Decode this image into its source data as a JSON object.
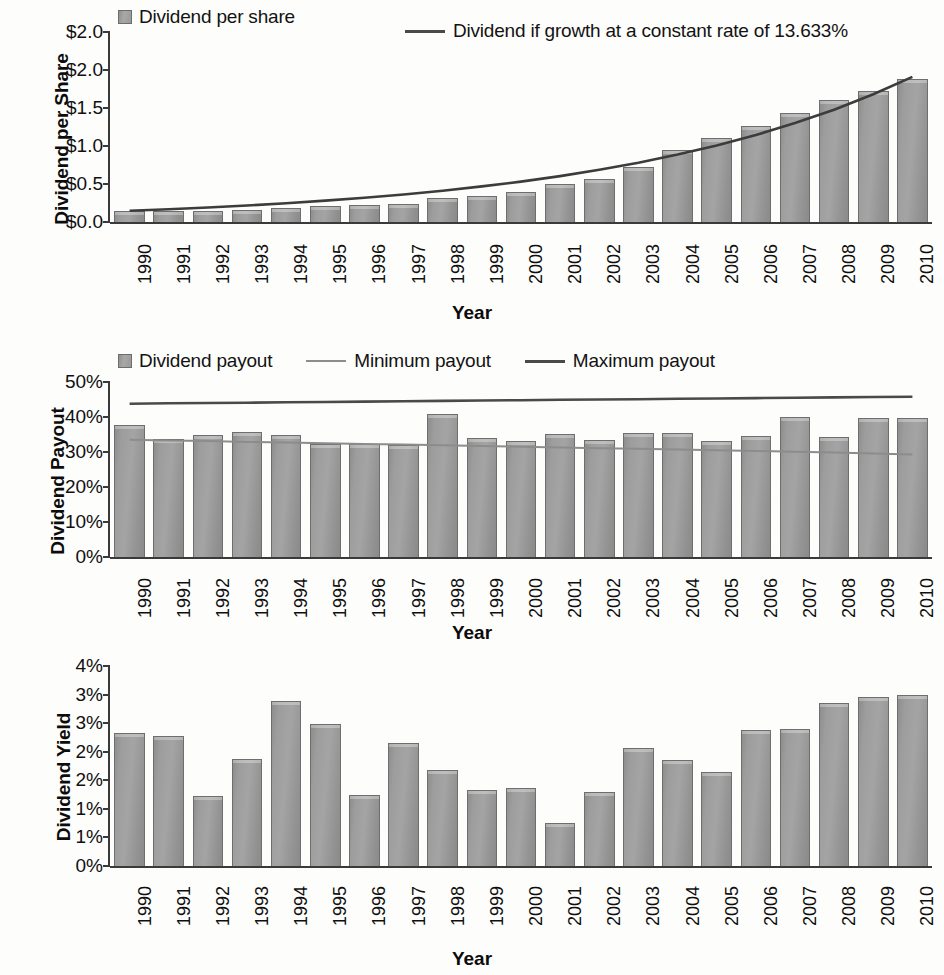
{
  "chart_data": [
    {
      "type": "bar",
      "title": "",
      "ylabel": "Dividend per Share",
      "xlabel": "Year",
      "categories": [
        "1990",
        "1991",
        "1992",
        "1993",
        "1994",
        "1995",
        "1996",
        "1997",
        "1998",
        "1999",
        "2000",
        "2001",
        "2002",
        "2003",
        "2004",
        "2005",
        "2006",
        "2007",
        "2008",
        "2009",
        "2010"
      ],
      "ytick_labels": [
        "$2.0",
        "$2.0",
        "$1.5",
        "$1.0",
        "$0.5",
        "$0.0"
      ],
      "ytick_values": [
        2.5,
        2.0,
        1.5,
        1.0,
        0.5,
        0.0
      ],
      "ylim": [
        0,
        2.5
      ],
      "grid": false,
      "legend_position": "top",
      "series": [
        {
          "name": "Dividend per share",
          "kind": "bar",
          "color": "#9a9a9a",
          "values": [
            0.14,
            0.14,
            0.15,
            0.16,
            0.19,
            0.21,
            0.22,
            0.24,
            0.31,
            0.34,
            0.4,
            0.5,
            0.57,
            0.73,
            0.95,
            1.1,
            1.26,
            1.43,
            1.6,
            1.73,
            1.88
          ]
        },
        {
          "name": "Dividend if growth at a constant rate of 13.633%",
          "kind": "line",
          "color": "#3c3c3c",
          "values": [
            0.148,
            0.168,
            0.191,
            0.217,
            0.247,
            0.281,
            0.319,
            0.362,
            0.412,
            0.468,
            0.532,
            0.604,
            0.687,
            0.78,
            0.887,
            1.008,
            1.145,
            1.301,
            1.478,
            1.68,
            1.909
          ]
        }
      ]
    },
    {
      "type": "bar",
      "title": "",
      "ylabel": "Dividend Payout",
      "xlabel": "Year",
      "categories": [
        "1990",
        "1991",
        "1992",
        "1993",
        "1994",
        "1995",
        "1996",
        "1997",
        "1998",
        "1999",
        "2000",
        "2001",
        "2002",
        "2003",
        "2004",
        "2005",
        "2006",
        "2007",
        "2008",
        "2009",
        "2010"
      ],
      "ytick_labels": [
        "50%",
        "40%",
        "30%",
        "20%",
        "10%",
        "0%"
      ],
      "ytick_values": [
        50,
        40,
        30,
        20,
        10,
        0
      ],
      "ylim": [
        0,
        50
      ],
      "grid": false,
      "legend_position": "top",
      "series": [
        {
          "name": "Dividend payout",
          "kind": "bar",
          "color": "#9a9a9a",
          "values": [
            37.7,
            33.8,
            34.8,
            35.8,
            35.0,
            32.3,
            32.3,
            32.0,
            41.0,
            34.0,
            33.2,
            35.2,
            33.3,
            35.5,
            35.3,
            33.2,
            34.7,
            39.9,
            34.3,
            39.8,
            39.6
          ]
        },
        {
          "name": "Minimum payout",
          "kind": "line",
          "color": "#8c8c8c",
          "values": [
            33.5,
            33.3,
            33.1,
            32.9,
            32.7,
            32.5,
            32.3,
            32.1,
            31.9,
            31.7,
            31.5,
            31.3,
            31.1,
            30.9,
            30.7,
            30.5,
            30.3,
            30.1,
            29.9,
            29.6,
            29.3
          ]
        },
        {
          "name": "Maximum payout",
          "kind": "line",
          "color": "#4a4a4a",
          "values": [
            43.8,
            43.9,
            44.0,
            44.1,
            44.2,
            44.3,
            44.4,
            44.5,
            44.6,
            44.7,
            44.8,
            44.9,
            45.0,
            45.1,
            45.2,
            45.3,
            45.4,
            45.5,
            45.6,
            45.7,
            45.8
          ]
        }
      ]
    },
    {
      "type": "bar",
      "title": "",
      "ylabel": "Dividend Yield",
      "xlabel": "Year",
      "categories": [
        "1990",
        "1991",
        "1992",
        "1993",
        "1994",
        "1995",
        "1996",
        "1997",
        "1998",
        "1999",
        "2000",
        "2001",
        "2002",
        "2003",
        "2004",
        "2005",
        "2006",
        "2007",
        "2008",
        "2009",
        "2010"
      ],
      "ytick_labels": [
        "4%",
        "3%",
        "3%",
        "2%",
        "2%",
        "1%",
        "1%",
        "0%"
      ],
      "ytick_values": [
        3.5,
        3.0,
        2.5,
        2.0,
        1.5,
        1.0,
        0.5,
        0.0
      ],
      "ylim": [
        0,
        3.5
      ],
      "grid": false,
      "legend_position": "none",
      "series": [
        {
          "name": "Dividend yield",
          "kind": "bar",
          "color": "#9a9a9a",
          "values": [
            2.32,
            2.28,
            1.22,
            1.88,
            2.88,
            2.48,
            1.25,
            2.15,
            1.68,
            1.33,
            1.37,
            0.75,
            1.3,
            2.07,
            1.85,
            1.65,
            2.38,
            2.4,
            2.85,
            2.95,
            3.0
          ]
        }
      ]
    }
  ],
  "chart1": {
    "ylabel": "Dividend per Share",
    "xlabel": "Year",
    "legend": {
      "bar_label": "Dividend per share",
      "line_label": "Dividend if growth at a constant rate of 13.633%"
    }
  },
  "chart2": {
    "ylabel": "Dividend Payout",
    "xlabel": "Year",
    "legend": {
      "bar_label": "Dividend payout",
      "min_label": "Minimum payout",
      "max_label": "Maximum payout"
    }
  },
  "chart3": {
    "ylabel": "Dividend Yield",
    "xlabel": "Year"
  },
  "colors": {
    "bar_fill": "#9a9a9a",
    "bar_stroke": "#6e6e6e",
    "axis": "#3a3a3a",
    "line_dark": "#3c3c3c",
    "line_light": "#8c8c8c",
    "background": "#fdfdfb"
  }
}
